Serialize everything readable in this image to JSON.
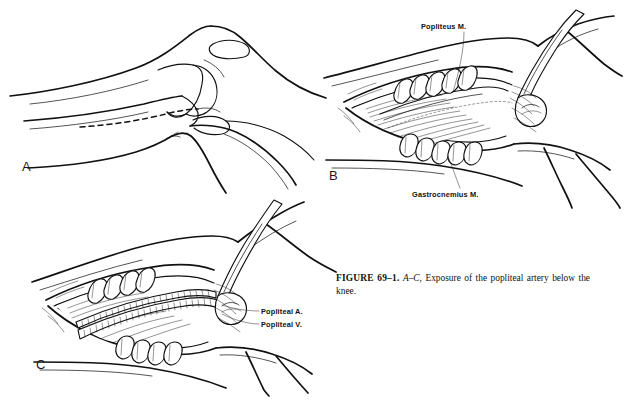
{
  "figure": {
    "caption_label": "FIGURE 69–1.",
    "caption_panels": "A–C,",
    "caption_text_line1": "Exposure of the popliteal artery below",
    "caption_text_line2": "the knee.",
    "background_color": "#ffffff",
    "ink_color": "#111111"
  },
  "panels": [
    {
      "letter": "A",
      "name": "knee-profile-incision",
      "description": "Lateral profile of the knee showing femur, patella and tibia with dashed incision line below the knee",
      "annotations": []
    },
    {
      "letter": "B",
      "name": "superficial-exposure",
      "description": "Surgical wound held open by retractors exposing muscle bellies",
      "annotations": [
        {
          "label": "Popliteus M.",
          "name": "popliteus-muscle-label"
        },
        {
          "label": "Gastrocnemius M.",
          "name": "gastrocnemius-muscle-label"
        }
      ]
    },
    {
      "letter": "C",
      "name": "deep-exposure-vessels",
      "description": "Deeper dissection exposing the popliteal artery and vein within the wound",
      "annotations": [
        {
          "label": "Popliteal A.",
          "name": "popliteal-artery-label"
        },
        {
          "label": "Popliteal V.",
          "name": "popliteal-vein-label"
        }
      ]
    }
  ]
}
